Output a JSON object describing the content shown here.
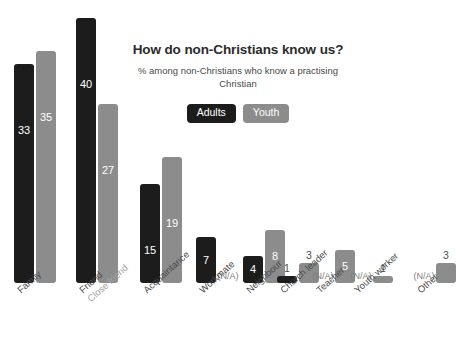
{
  "chart_data": {
    "type": "bar",
    "title": "How do non-Christians know us?",
    "subtitle": "% among non-Christians who know a practising Christian",
    "xlabel": "",
    "ylabel": "",
    "ylim": [
      0,
      40
    ],
    "grid": false,
    "legend_position": "top-center",
    "colors": {
      "adults": "#1c1c1c",
      "youth": "#8c8c8c",
      "na_text": "#7d7d7d",
      "label_text": "#4a4a4a",
      "sub_label_text": "#a3a3a3",
      "background": "#ffffff"
    },
    "categories": [
      "Family",
      "Friend",
      "Acquaintance",
      "Workmate",
      "Neighbour",
      "Church leader",
      "Teacher",
      "Youth worker",
      "Other"
    ],
    "category_sublabels": [
      "",
      "Close friend",
      "",
      "",
      "",
      "",
      "",
      "",
      ""
    ],
    "series": [
      {
        "name": "Adults",
        "values": [
          33,
          40,
          15,
          7,
          4,
          1,
          null,
          null,
          null
        ]
      },
      {
        "name": "Youth",
        "values": [
          35,
          27,
          19,
          null,
          8,
          3,
          5,
          1,
          3
        ]
      }
    ],
    "na_text": "(N/A)",
    "legend": [
      {
        "label": "Adults",
        "color": "#1c1c1c"
      },
      {
        "label": "Youth",
        "color": "#8c8c8c"
      }
    ],
    "value_labels": {
      "family": [
        "33",
        "35"
      ],
      "friend": [
        "40",
        "27"
      ],
      "acquaintance": [
        "15",
        "19"
      ],
      "workmate": [
        "7",
        "(N/A)"
      ],
      "neighbour": [
        "4",
        "8"
      ],
      "church_leader": [
        "1",
        "3"
      ],
      "teacher": [
        "(N/A)",
        "5"
      ],
      "youth_worker": [
        "(N/A)",
        "1"
      ],
      "other": [
        "(N/A)",
        "3"
      ]
    }
  }
}
